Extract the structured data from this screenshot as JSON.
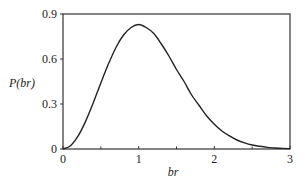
{
  "chart_data": {
    "type": "line",
    "title": "",
    "xlabel": "br",
    "ylabel": "P(br)",
    "xlim": [
      0,
      3
    ],
    "ylim": [
      0,
      0.9
    ],
    "x_ticks": [
      0,
      1,
      2,
      3
    ],
    "x_tick_labels": [
      "0",
      "1",
      "2",
      "3"
    ],
    "x_minor_ticks": [
      0.5,
      1.5,
      2.5
    ],
    "y_ticks": [
      0,
      0.3,
      0.6,
      0.9
    ],
    "y_tick_labels": [
      "0",
      "0.3",
      "0.6",
      "0.9"
    ],
    "grid": false,
    "legend": null,
    "series": [
      {
        "name": "P(br)",
        "color": "#222222",
        "x": [
          0,
          0.1,
          0.2,
          0.3,
          0.4,
          0.5,
          0.6,
          0.7,
          0.8,
          0.9,
          1.0,
          1.1,
          1.2,
          1.3,
          1.4,
          1.5,
          1.6,
          1.7,
          1.8,
          1.9,
          2.0,
          2.1,
          2.2,
          2.3,
          2.4,
          2.5,
          2.6,
          2.7,
          2.8,
          2.9,
          3.0
        ],
        "y": [
          0,
          0.022,
          0.087,
          0.186,
          0.308,
          0.44,
          0.566,
          0.677,
          0.76,
          0.81,
          0.83,
          0.81,
          0.77,
          0.7,
          0.62,
          0.53,
          0.45,
          0.36,
          0.29,
          0.22,
          0.165,
          0.12,
          0.087,
          0.06,
          0.041,
          0.027,
          0.018,
          0.011,
          0.007,
          0.004,
          0.0025
        ]
      }
    ]
  }
}
